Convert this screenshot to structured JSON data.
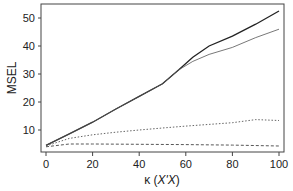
{
  "chart_data": {
    "type": "line",
    "title": "",
    "xlabel": "κ (X'X)",
    "ylabel": "MSEL",
    "xlim": [
      0,
      100
    ],
    "ylim": [
      2,
      55
    ],
    "xticks": [
      0,
      20,
      40,
      60,
      80,
      100
    ],
    "yticks": [
      10,
      20,
      30,
      40,
      50
    ],
    "grid": false,
    "legend": null,
    "series": [
      {
        "name": "solid-thick",
        "style": "solid",
        "width": 1.3,
        "color": "#222222",
        "x": [
          0,
          10,
          20,
          30,
          40,
          50,
          57,
          63,
          70,
          80,
          90,
          100
        ],
        "y": [
          4.5,
          8.6,
          12.8,
          17.5,
          22.0,
          26.5,
          31.5,
          36.0,
          40.0,
          43.5,
          47.8,
          52.5
        ]
      },
      {
        "name": "solid-thin",
        "style": "solid",
        "width": 0.8,
        "color": "#555555",
        "x": [
          0,
          10,
          20,
          30,
          40,
          50,
          57,
          63,
          70,
          80,
          90,
          100
        ],
        "y": [
          4.5,
          8.6,
          12.8,
          17.5,
          22.0,
          26.5,
          31.5,
          34.5,
          37.0,
          39.5,
          43.0,
          46.0
        ]
      },
      {
        "name": "dotted",
        "style": "dotted",
        "width": 0.9,
        "color": "#555555",
        "x": [
          0,
          10,
          20,
          30,
          40,
          50,
          60,
          70,
          80,
          90,
          100
        ],
        "y": [
          4.3,
          7.0,
          8.3,
          9.2,
          10.0,
          10.7,
          11.4,
          12.0,
          12.6,
          13.7,
          13.4
        ]
      },
      {
        "name": "dashed",
        "style": "dashed",
        "width": 0.9,
        "color": "#444444",
        "x": [
          0,
          10,
          20,
          40,
          60,
          80,
          100
        ],
        "y": [
          4.0,
          5.0,
          5.0,
          4.9,
          4.8,
          4.6,
          4.3
        ]
      }
    ]
  }
}
